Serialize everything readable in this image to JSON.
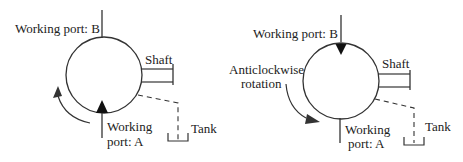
{
  "colors": {
    "stroke": "#333333",
    "text": "#222222",
    "background": "#ffffff"
  },
  "left_diagram": {
    "port_b_label": "Working port: B",
    "shaft_label": "Shaft",
    "port_a_line1": "Working",
    "port_a_line2": "port: A",
    "tank_label": "Tank",
    "rotation_arrow": "clockwise-arrow-up"
  },
  "right_diagram": {
    "port_b_label": "Working port: B",
    "shaft_label": "Shaft",
    "rotation_line1": "Anticlockwise",
    "rotation_line2": "rotation",
    "port_a_line1": "Working",
    "port_a_line2": "port: A",
    "tank_label": "Tank"
  }
}
